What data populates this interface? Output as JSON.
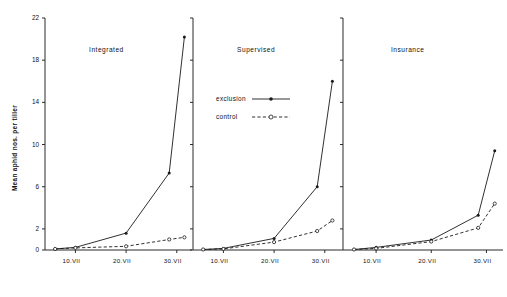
{
  "figure": {
    "ylabel": "Mean aphid nos. per tiller",
    "xlabel": ""
  },
  "legend": {
    "position": "panel-2-top",
    "items": [
      {
        "label": "exclusion",
        "style": "solid",
        "marker": "filled-circle"
      },
      {
        "label": "control",
        "style": "dashed",
        "marker": "open-circle"
      }
    ]
  },
  "axis": {
    "yticks": [
      0,
      2,
      6,
      10,
      14,
      18,
      22
    ],
    "ytick_labels": [
      "0",
      "2",
      "6",
      "10",
      "14",
      "18",
      "22"
    ],
    "ylim": [
      0,
      22
    ],
    "xticks": [
      10,
      20,
      30
    ],
    "xtick_labels": [
      "10.VII",
      "20.VII",
      "30.VII"
    ],
    "xlim": [
      4,
      33
    ]
  },
  "chart_data": {
    "type": "line",
    "title": "",
    "subtitle": "",
    "xlabel": "",
    "ylabel": "Mean aphid nos. per tiller",
    "xlim": [
      4,
      33
    ],
    "ylim": [
      0,
      22
    ],
    "grid": false,
    "legend_position": "panel-2-top",
    "xtick_labels": [
      "10.VII",
      "20.VII",
      "30.VII"
    ],
    "ytick_labels": [
      "0",
      "2",
      "6",
      "10",
      "14",
      "18",
      "22"
    ],
    "panels": [
      {
        "title": "Integrated",
        "series": [
          {
            "name": "exclusion",
            "style": "solid",
            "marker": "filled-circle",
            "x": [
              6,
              10,
              20,
              28.5,
              31.5
            ],
            "y": [
              0.1,
              0.25,
              1.6,
              7.3,
              20.2
            ]
          },
          {
            "name": "control",
            "style": "dashed",
            "marker": "open-circle",
            "x": [
              6,
              10,
              20,
              28.5,
              31.5
            ],
            "y": [
              0.1,
              0.2,
              0.35,
              1.0,
              1.2
            ]
          }
        ]
      },
      {
        "title": "Supervised",
        "series": [
          {
            "name": "exclusion",
            "style": "solid",
            "marker": "filled-circle",
            "x": [
              6,
              10,
              20,
              28.5,
              31.5
            ],
            "y": [
              0.05,
              0.15,
              1.1,
              6.0,
              16.0
            ]
          },
          {
            "name": "control",
            "style": "dashed",
            "marker": "open-circle",
            "x": [
              6,
              10,
              20,
              28.5,
              31.5
            ],
            "y": [
              0.05,
              0.1,
              0.75,
              1.8,
              2.8
            ]
          }
        ]
      },
      {
        "title": "Insurance",
        "series": [
          {
            "name": "exclusion",
            "style": "solid",
            "marker": "filled-circle",
            "x": [
              6,
              10,
              20,
              28.5,
              31.5
            ],
            "y": [
              0.05,
              0.25,
              0.95,
              3.3,
              9.4
            ]
          },
          {
            "name": "control",
            "style": "dashed",
            "marker": "open-circle",
            "x": [
              6,
              10,
              20,
              28.5,
              31.5
            ],
            "y": [
              0.05,
              0.15,
              0.8,
              2.1,
              4.4
            ]
          }
        ]
      }
    ]
  }
}
